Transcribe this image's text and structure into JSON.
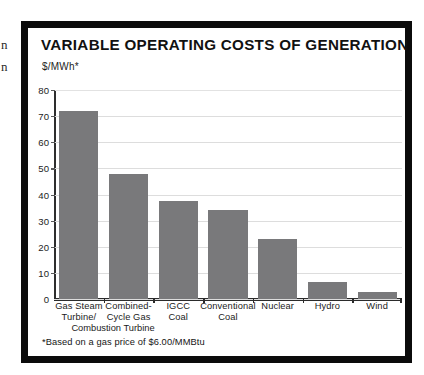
{
  "page_bleed": {
    "fragment_1": "n",
    "fragment_2": "n"
  },
  "figure": {
    "title": "VARIABLE OPERATING COSTS OF GENERATION",
    "unit_label": "$/MWh*",
    "footnote": "*Based on a gas price of $6.00/MMBtu",
    "frame_color": "#0b0b0b",
    "bar_color": "#79797b",
    "gridline_color": "#dddddd",
    "axis_color": "#2b2b2b"
  },
  "chart_data": {
    "type": "bar",
    "title": "VARIABLE OPERATING COSTS OF GENERATION",
    "xlabel": "",
    "ylabel": "$/MWh*",
    "ylim": [
      0,
      80
    ],
    "yticks": [
      0,
      10,
      20,
      30,
      40,
      50,
      60,
      70,
      80
    ],
    "ytick_labels": [
      "0",
      "10",
      "20",
      "30",
      "40",
      "50",
      "60",
      "70",
      "80"
    ],
    "grid": true,
    "legend": "none",
    "annotations": [
      "*Based on a gas price of $6.00/MMBtu"
    ],
    "categories": [
      "Gas Steam Turbine/ Combustion Turbine",
      "Combined-Cycle Gas",
      "IGCC Coal",
      "Conventional Coal",
      "Nuclear",
      "Hydro",
      "Wind"
    ],
    "category_lines": [
      [
        "Gas Steam",
        "Turbine/",
        "Combustion Turbine"
      ],
      [
        "Combined-",
        "Cycle Gas"
      ],
      [
        "IGCC",
        "Coal"
      ],
      [
        "Conventional",
        "Coal"
      ],
      [
        "Nuclear"
      ],
      [
        "Hydro"
      ],
      [
        "Wind"
      ]
    ],
    "values": [
      72,
      48,
      37.5,
      34,
      23,
      6.5,
      2.8
    ]
  }
}
